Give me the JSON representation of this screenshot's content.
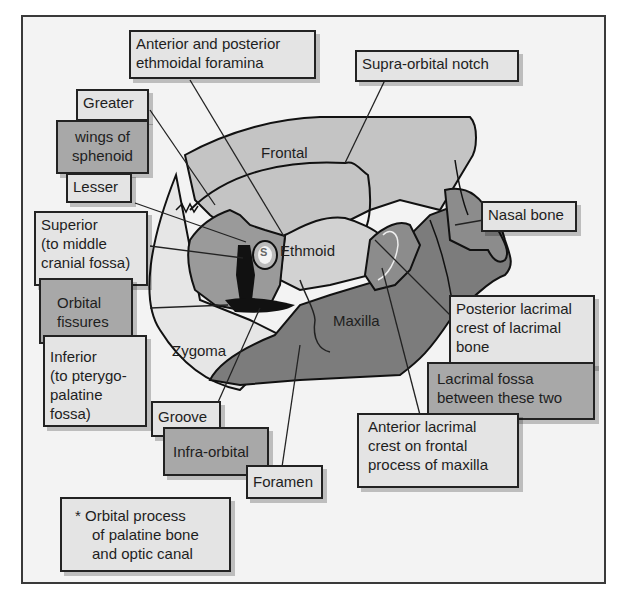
{
  "diagram": {
    "region_labels": {
      "frontal": "Frontal",
      "ethmoid": "Ethmoid",
      "maxilla": "Maxilla",
      "zygoma": "Zygoma",
      "s_marker": "S"
    },
    "callouts": {
      "ethmoidal_foramina": [
        "Anterior and posterior",
        "ethmoidal foramina"
      ],
      "supra_orbital_notch": [
        "Supra-orbital notch"
      ],
      "greater": [
        "Greater"
      ],
      "wings_of_sphenoid": [
        "wings of",
        "sphenoid"
      ],
      "lesser": [
        "Lesser"
      ],
      "superior_fissure": [
        "Superior",
        "(to middle",
        "cranial fossa)"
      ],
      "orbital_fissures": [
        "Orbital",
        "fissures"
      ],
      "inferior_fissure": [
        "Inferior",
        "(to pterygo-",
        "palatine",
        "fossa)"
      ],
      "nasal_bone": [
        "Nasal bone"
      ],
      "posterior_lacrimal_crest": [
        "Posterior lacrimal",
        "crest of lacrimal",
        "bone"
      ],
      "lacrimal_fossa": [
        "Lacrimal fossa",
        "between these two"
      ],
      "anterior_lacrimal_crest": [
        "Anterior lacrimal",
        "crest on frontal",
        "process of maxilla"
      ],
      "groove": [
        "Groove"
      ],
      "infra_orbital": [
        "Infra-orbital"
      ],
      "foramen": [
        "Foramen"
      ],
      "footnote": [
        "*  Orbital process",
        "of palatine bone",
        "and optic canal"
      ]
    },
    "colors": {
      "background": "#f3f3f3",
      "frontal": "#c4c4c4",
      "ethmoid": "#d2d2d2",
      "sphenoid": "#9a9a9a",
      "maxilla": "#7c7c7c",
      "lacrimal": "#8c8c8c",
      "zygoma_area": "#e6e6e6",
      "fissure": "#111111",
      "label_light": "#e4e4e4",
      "label_dark": "#a8a8a8"
    }
  }
}
